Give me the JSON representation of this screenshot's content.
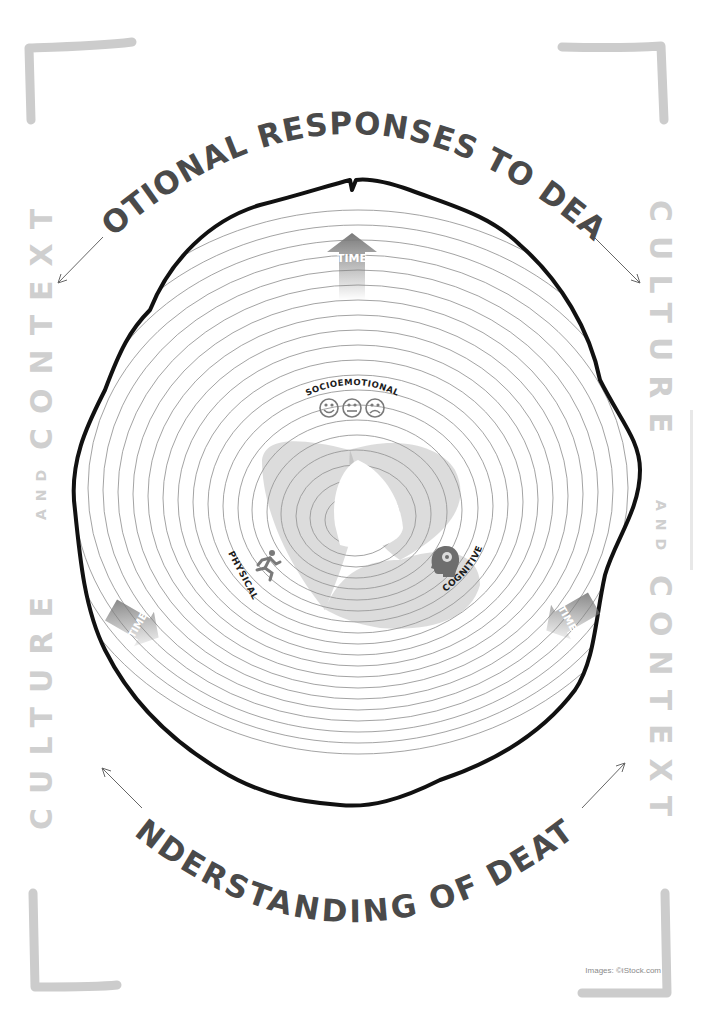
{
  "titles": {
    "top": "EMOTIONAL RESPONSES TO DEATH",
    "bottom": "UNDERSTANDING OF DEATH"
  },
  "side_labels": {
    "left": {
      "word1": "CULTURE",
      "conj": "AND",
      "word2": "CONTEXT"
    },
    "right": {
      "word1": "CULTURE",
      "conj": "AND",
      "word2": "CONTEXT"
    }
  },
  "domains": [
    {
      "label": "SOCIOEMOTIONAL",
      "icon": "faces-happy-neutral-sad-icon"
    },
    {
      "label": "PHYSICAL",
      "icon": "running-person-icon"
    },
    {
      "label": "COGNITIVE",
      "icon": "head-lightbulb-gear-icon"
    }
  ],
  "time_arrows": [
    {
      "label": "TIME",
      "direction": "up"
    },
    {
      "label": "TIME",
      "direction": "down-left"
    },
    {
      "label": "TIME",
      "direction": "down-right"
    }
  ],
  "credit": "Images: ©iStock.com",
  "colors": {
    "title": "#4a4a4a",
    "side_text": "#cfcfcf",
    "bracket": "#cccccc",
    "trunk_outline": "#111111",
    "ring_line": "#8c8c8c",
    "venn_fill": "#9a9a9a",
    "arrow_fill": "#8a8a8a"
  }
}
